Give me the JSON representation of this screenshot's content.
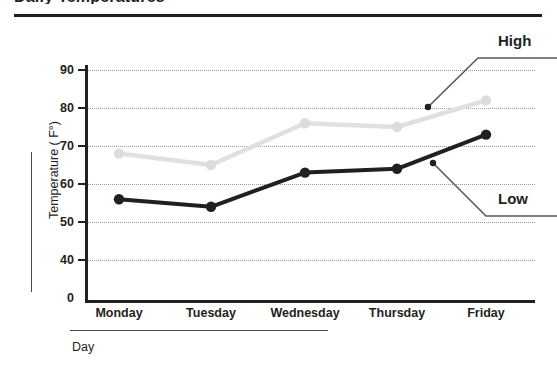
{
  "title": "Daily Temperatures",
  "chart_data": {
    "type": "line",
    "title": "Daily Temperatures",
    "xlabel": "Day",
    "ylabel": "Temperature ( F°)",
    "categories": [
      "Monday",
      "Tuesday",
      "Wednesday",
      "Thursday",
      "Friday"
    ],
    "series": [
      {
        "name": "High",
        "values": [
          68,
          65,
          76,
          75,
          82
        ],
        "color": "#e0e0e0"
      },
      {
        "name": "Low",
        "values": [
          56,
          54,
          63,
          64,
          73
        ],
        "color": "#231f20"
      }
    ],
    "ylim": [
      40,
      90
    ],
    "yticks": [
      "0",
      "40",
      "50",
      "60",
      "70",
      "80",
      "90"
    ],
    "y_axis_break": true,
    "grid": true,
    "legend_position": "callout-right"
  },
  "annotations": {
    "high_label": "High",
    "low_label": "Low"
  },
  "axes": {
    "y_title": "Temperature ( F°)",
    "x_title": "Day"
  }
}
